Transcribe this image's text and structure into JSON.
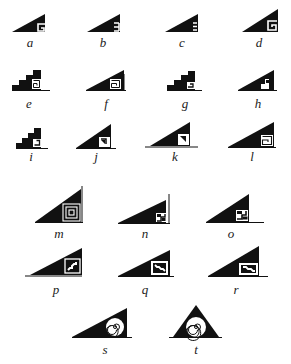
{
  "figure": {
    "ink_color": "#111111",
    "background": "#ffffff",
    "panels": [
      {
        "id": "a",
        "label": "a",
        "motif": "triangle-with-G-fret"
      },
      {
        "id": "b",
        "label": "b",
        "motif": "triangle-with-E-fret"
      },
      {
        "id": "c",
        "label": "c",
        "motif": "triangle-with-E-fret"
      },
      {
        "id": "d",
        "label": "d",
        "motif": "triangle-with-scroll-fret"
      },
      {
        "id": "e",
        "label": "e",
        "motif": "stepped-with-spiral-square"
      },
      {
        "id": "f",
        "label": "f",
        "motif": "triangle-with-spiral-square"
      },
      {
        "id": "g",
        "label": "g",
        "motif": "stepped-with-hook"
      },
      {
        "id": "h",
        "label": "h",
        "motif": "triangle-with-stepped-notch"
      },
      {
        "id": "i",
        "label": "i",
        "motif": "stepped-with-hook"
      },
      {
        "id": "j",
        "label": "j",
        "motif": "triangle-with-hook-square"
      },
      {
        "id": "k",
        "label": "k",
        "motif": "triangle-with-hook-square-baseline"
      },
      {
        "id": "l",
        "label": "l",
        "motif": "triangle-with-scroll-square"
      },
      {
        "id": "m",
        "label": "m",
        "motif": "triangle-with-nested-spiral"
      },
      {
        "id": "n",
        "label": "n",
        "motif": "triangle-with-Z-fret"
      },
      {
        "id": "o",
        "label": "o",
        "motif": "triangle-with-Z-fret-baseline"
      },
      {
        "id": "p",
        "label": "p",
        "motif": "triangle-with-diagonal-step-box"
      },
      {
        "id": "q",
        "label": "q",
        "motif": "triangle-with-diagonal-step-box"
      },
      {
        "id": "r",
        "label": "r",
        "motif": "triangle-with-diagonal-step-box"
      },
      {
        "id": "s",
        "label": "s",
        "motif": "triangle-with-spiral"
      },
      {
        "id": "t",
        "label": "t",
        "motif": "isosceles-triangle-with-spiral"
      }
    ]
  }
}
